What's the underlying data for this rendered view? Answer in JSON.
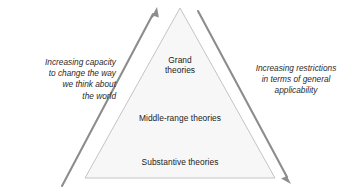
{
  "diagram": {
    "type": "pyramid-hierarchy",
    "background_color": "#ffffff",
    "triangle": {
      "fill_color": "#f7f7f7",
      "stroke_color": "#b9b9b9",
      "apex": "180,8",
      "base_left": "85,178",
      "base_right": "275,178"
    },
    "layers": [
      {
        "name": "grand",
        "label": "Grand\ntheories",
        "position": "top"
      },
      {
        "name": "middle-range",
        "label": "Middle-range theories",
        "position": "middle"
      },
      {
        "name": "substantive",
        "label": "Substantive theories",
        "position": "bottom"
      }
    ],
    "arrows": [
      {
        "name": "left-arrow",
        "direction": "up-right",
        "color": "#8f8f8f",
        "caption": "Increasing capacity\nto change the way\nwe think about\nthe world"
      },
      {
        "name": "right-arrow",
        "direction": "down-right",
        "color": "#8f8f8f",
        "caption": "Increasing restrictions\nin terms of general\napplicability"
      }
    ],
    "captions": {
      "left": "Increasing capacity\nto change the way\nwe think about\nthe world",
      "right": "Increasing restrictions\nin terms of general\napplicability"
    },
    "text_color": "#1c1c1c"
  }
}
